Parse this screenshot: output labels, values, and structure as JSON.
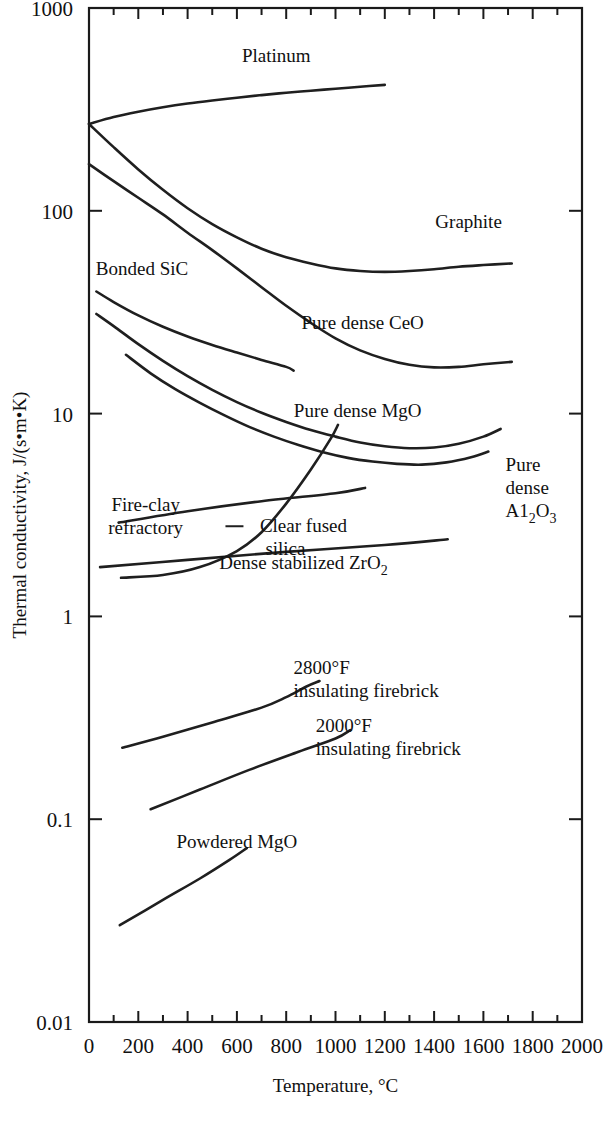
{
  "chart_data": {
    "type": "line",
    "title": "",
    "xlabel": "Temperature, °C",
    "ylabel": "Thermal conductivity, J/(s•m•K)",
    "xlim": [
      0,
      2000
    ],
    "ylim": [
      0.01,
      1000
    ],
    "yscale": "log",
    "grid": false,
    "legend_position": "inline-labels",
    "xticks": [
      0,
      200,
      400,
      600,
      800,
      1000,
      1200,
      1400,
      1600,
      1800,
      2000
    ],
    "xtick_labels": [
      "0",
      "200",
      "400",
      "600",
      "800",
      "1000",
      "1200",
      "1400",
      "1600",
      "1800",
      "2000"
    ],
    "xminor_step": 100,
    "yticks": [
      0.01,
      0.1,
      1,
      10,
      100,
      1000
    ],
    "ytick_labels": [
      "0.01",
      "0.1",
      "1",
      "10",
      "100",
      "1000"
    ],
    "series": [
      {
        "name": "Platinum",
        "label": "Platinum",
        "label_x": 760,
        "label_y": 540,
        "points": [
          [
            0,
            268
          ],
          [
            100,
            290
          ],
          [
            200,
            308
          ],
          [
            300,
            324
          ],
          [
            400,
            338
          ],
          [
            500,
            350
          ],
          [
            600,
            361
          ],
          [
            700,
            372
          ],
          [
            800,
            382
          ],
          [
            900,
            391
          ],
          [
            1000,
            400
          ],
          [
            1100,
            409
          ],
          [
            1200,
            418
          ]
        ]
      },
      {
        "name": "Graphite",
        "label": "Graphite",
        "label_x": 1540,
        "label_y": 82,
        "points": [
          [
            0,
            268
          ],
          [
            100,
            206
          ],
          [
            200,
            160
          ],
          [
            300,
            127
          ],
          [
            400,
            103
          ],
          [
            500,
            86
          ],
          [
            600,
            74
          ],
          [
            700,
            65
          ],
          [
            800,
            59
          ],
          [
            900,
            55
          ],
          [
            1000,
            52
          ],
          [
            1100,
            50.5
          ],
          [
            1200,
            50
          ],
          [
            1300,
            50.5
          ],
          [
            1400,
            51.5
          ],
          [
            1500,
            53
          ],
          [
            1600,
            54
          ],
          [
            1715,
            55
          ]
        ]
      },
      {
        "name": "Pure dense CeO",
        "label": "Pure dense CeO",
        "label_x": 1110,
        "label_y": 26,
        "points": [
          [
            0,
            170
          ],
          [
            100,
            140
          ],
          [
            200,
            116
          ],
          [
            300,
            96
          ],
          [
            400,
            78
          ],
          [
            500,
            64
          ],
          [
            600,
            52
          ],
          [
            700,
            42
          ],
          [
            800,
            34
          ],
          [
            900,
            28
          ],
          [
            1000,
            23.5
          ],
          [
            1100,
            20.5
          ],
          [
            1200,
            18.6
          ],
          [
            1300,
            17.4
          ],
          [
            1400,
            16.9
          ],
          [
            1500,
            17
          ],
          [
            1600,
            17.5
          ],
          [
            1715,
            18
          ]
        ]
      },
      {
        "name": "Bonded SiC",
        "label": "Bonded SiC",
        "label_x": 215,
        "label_y": 48,
        "points": [
          [
            30,
            40
          ],
          [
            100,
            35.5
          ],
          [
            200,
            30.5
          ],
          [
            300,
            26.8
          ],
          [
            400,
            24
          ],
          [
            500,
            21.8
          ],
          [
            600,
            20
          ],
          [
            700,
            18.4
          ],
          [
            800,
            17
          ],
          [
            830,
            16.3
          ]
        ]
      },
      {
        "name": "Pure dense MgO",
        "label": "Pure dense MgO",
        "label_x": 1090,
        "label_y": 9.6,
        "points": [
          [
            30,
            31
          ],
          [
            100,
            27
          ],
          [
            200,
            22
          ],
          [
            300,
            18.2
          ],
          [
            400,
            15.3
          ],
          [
            500,
            13.1
          ],
          [
            600,
            11.4
          ],
          [
            700,
            10.1
          ],
          [
            800,
            9.1
          ],
          [
            900,
            8.3
          ],
          [
            1000,
            7.7
          ],
          [
            1100,
            7.2
          ],
          [
            1200,
            6.9
          ],
          [
            1300,
            6.75
          ],
          [
            1400,
            6.8
          ],
          [
            1500,
            7.1
          ],
          [
            1600,
            7.7
          ],
          [
            1670,
            8.4
          ]
        ]
      },
      {
        "name": "Pure dense Al2O3",
        "label": "Pure dense A1",
        "label_sub": "2",
        "label_tail": "O",
        "label_sub2": "3",
        "label_x": 1690,
        "label_y": 5.2,
        "points": [
          [
            150,
            19.5
          ],
          [
            250,
            15.8
          ],
          [
            350,
            13.2
          ],
          [
            450,
            11.3
          ],
          [
            550,
            9.8
          ],
          [
            650,
            8.6
          ],
          [
            750,
            7.7
          ],
          [
            850,
            7
          ],
          [
            950,
            6.45
          ],
          [
            1050,
            6.05
          ],
          [
            1150,
            5.8
          ],
          [
            1250,
            5.65
          ],
          [
            1350,
            5.6
          ],
          [
            1450,
            5.75
          ],
          [
            1550,
            6.1
          ],
          [
            1620,
            6.5
          ]
        ]
      },
      {
        "name": "Fire-clay refractory",
        "label": "Fire-clay refractory",
        "label_x": 230,
        "label_y": 3.3,
        "points": [
          [
            120,
            2.9
          ],
          [
            400,
            3.3
          ],
          [
            700,
            3.7
          ],
          [
            1000,
            4.05
          ],
          [
            1120,
            4.3
          ]
        ]
      },
      {
        "name": "Clear fused silica",
        "label": "Clear fused silica",
        "label_x": 870,
        "label_y": 2.6,
        "points": [
          [
            130,
            1.55
          ],
          [
            300,
            1.6
          ],
          [
            450,
            1.75
          ],
          [
            600,
            2.1
          ],
          [
            700,
            2.6
          ],
          [
            800,
            3.6
          ],
          [
            900,
            5.3
          ],
          [
            980,
            7.5
          ],
          [
            1010,
            8.8
          ]
        ]
      },
      {
        "name": "Dense stabilized ZrO2",
        "label": "Dense stabilized ZrO",
        "label_sub": "2",
        "label_x": 870,
        "label_y": 1.72,
        "points": [
          [
            45,
            1.75
          ],
          [
            400,
            1.9
          ],
          [
            800,
            2.08
          ],
          [
            1200,
            2.25
          ],
          [
            1455,
            2.4
          ]
        ]
      },
      {
        "name": "2800F insulating firebrick",
        "label_line1": "2800°F",
        "label_line2": "insulating firebrick",
        "label_x": 830,
        "label_y": 0.52,
        "points": [
          [
            135,
            0.225
          ],
          [
            300,
            0.255
          ],
          [
            500,
            0.3
          ],
          [
            700,
            0.355
          ],
          [
            800,
            0.4
          ],
          [
            880,
            0.45
          ],
          [
            935,
            0.48
          ]
        ]
      },
      {
        "name": "2000F insulating firebrick",
        "label_line1": "2000°F",
        "label_line2": "insulating firebrick",
        "label_x": 920,
        "label_y": 0.27,
        "points": [
          [
            250,
            0.112
          ],
          [
            450,
            0.14
          ],
          [
            650,
            0.175
          ],
          [
            850,
            0.215
          ],
          [
            1000,
            0.25
          ],
          [
            1060,
            0.275
          ]
        ]
      },
      {
        "name": "Powdered MgO",
        "label": "Powdered MgO",
        "label_x": 600,
        "label_y": 0.072,
        "points": [
          [
            125,
            0.03
          ],
          [
            300,
            0.04
          ],
          [
            450,
            0.051
          ],
          [
            570,
            0.063
          ],
          [
            640,
            0.072
          ]
        ]
      }
    ]
  }
}
